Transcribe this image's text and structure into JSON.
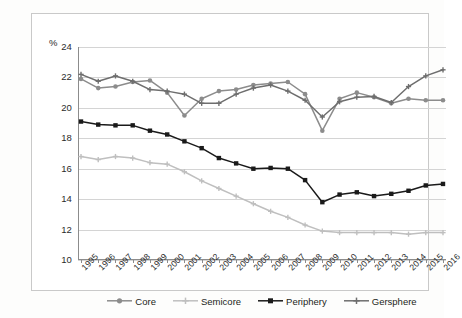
{
  "chart_data": {
    "type": "line",
    "title": "",
    "subtitle": "",
    "xlabel": "",
    "ylabel": "%",
    "y_unit_label": "%",
    "xlim_categories": [
      "1995",
      "1996",
      "1997",
      "1998",
      "1999",
      "2000",
      "2001",
      "2002",
      "2003",
      "2004",
      "2005",
      "2006",
      "2007",
      "2008",
      "2009",
      "2010",
      "2011",
      "2012",
      "2013",
      "2014",
      "2015",
      "2016"
    ],
    "categories": [
      "1995",
      "1996",
      "1997",
      "1998",
      "1999",
      "2000",
      "2001",
      "2002",
      "2003",
      "2004",
      "2005",
      "2006",
      "2007",
      "2008",
      "2009",
      "2010",
      "2011",
      "2012",
      "2013",
      "2014",
      "2015",
      "2016"
    ],
    "ylim": [
      10,
      24
    ],
    "ytick_step": 2,
    "yticks": [
      "24",
      "22",
      "20",
      "18",
      "16",
      "14",
      "12",
      "10"
    ],
    "ytick_values": [
      24,
      22,
      20,
      18,
      16,
      14,
      12,
      10
    ],
    "grid": true,
    "grid_axis": "y",
    "legend_position": "bottom",
    "series": [
      {
        "name": "Core",
        "color": "#8c8c8c",
        "marker": "circle",
        "values": [
          21.9,
          21.3,
          21.4,
          21.7,
          21.8,
          21.0,
          19.5,
          20.6,
          21.1,
          21.2,
          21.5,
          21.6,
          21.7,
          20.9,
          18.5,
          20.6,
          21.0,
          20.7,
          20.3,
          20.6,
          20.5,
          20.5
        ]
      },
      {
        "name": "Semicore",
        "color": "#bfbfbf",
        "marker": "plus",
        "values": [
          16.8,
          16.6,
          16.8,
          16.7,
          16.4,
          16.3,
          15.8,
          15.2,
          14.7,
          14.2,
          13.7,
          13.2,
          12.8,
          12.3,
          11.9,
          11.8,
          11.8,
          11.8,
          11.8,
          11.7,
          11.8,
          11.8
        ]
      },
      {
        "name": "Periphery",
        "color": "#1a1a1a",
        "marker": "square",
        "values": [
          19.1,
          18.9,
          18.85,
          18.85,
          18.5,
          18.25,
          17.8,
          17.35,
          16.7,
          16.35,
          16.0,
          16.05,
          16.0,
          15.25,
          13.8,
          14.3,
          14.45,
          14.2,
          14.35,
          14.55,
          14.9,
          15.0
        ]
      },
      {
        "name": "Gersphere",
        "color": "#6e6e6e",
        "marker": "plus",
        "values": [
          22.2,
          21.75,
          22.1,
          21.75,
          21.2,
          21.1,
          20.9,
          20.3,
          20.3,
          20.9,
          21.3,
          21.5,
          21.1,
          20.5,
          19.4,
          20.4,
          20.7,
          20.75,
          20.35,
          21.4,
          22.1,
          22.5
        ]
      }
    ]
  },
  "legend": {
    "items": [
      {
        "label": "Core"
      },
      {
        "label": "Semicore"
      },
      {
        "label": "Periphery"
      },
      {
        "label": "Gersphere"
      }
    ]
  }
}
